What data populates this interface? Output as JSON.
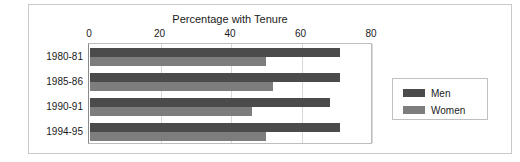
{
  "chart_data": {
    "type": "bar",
    "orientation": "horizontal",
    "title": "Percentage with Tenure",
    "xlabel": "",
    "ylabel": "",
    "xlim": [
      0,
      80
    ],
    "xticks": [
      0,
      20,
      40,
      60,
      80
    ],
    "xtick_labels": [
      "0",
      "20",
      "40",
      "60",
      "80"
    ],
    "grid": true,
    "legend_position": "right",
    "categories": [
      "1980-81",
      "1985-86",
      "1990-91",
      "1994-95"
    ],
    "series": [
      {
        "name": "Men",
        "color": "#4b4b4b",
        "values": [
          71,
          71,
          68,
          71
        ]
      },
      {
        "name": "Women",
        "color": "#7d7d7d",
        "values": [
          50,
          52,
          46,
          50
        ]
      }
    ]
  }
}
